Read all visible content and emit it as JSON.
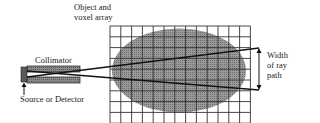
{
  "diagram": {
    "labels": {
      "object": [
        "Object and",
        "voxel array"
      ],
      "collimator": "Collimator",
      "source": "Source or Detector",
      "width": [
        "Width",
        "of ray",
        "path"
      ]
    },
    "grid": {
      "x": 110,
      "y": 26,
      "cols": 13,
      "rows": 9,
      "cell": 10.8,
      "color": "#333333"
    },
    "object_ellipse": {
      "cx": 179,
      "cy": 70.5,
      "rx": 67,
      "ry": 42,
      "fill": "#8c8c8c"
    },
    "collimator": {
      "upper_bar": {
        "x": 27,
        "y": 66,
        "w": 53,
        "h": 6
      },
      "lower_bar": {
        "x": 27,
        "y": 77,
        "w": 53,
        "h": 6
      },
      "fill": "#777777"
    },
    "source_block": {
      "x": 21,
      "y": 67,
      "w": 6,
      "h": 15,
      "fill": "#666666"
    },
    "rays": [
      {
        "x1": 27,
        "y1": 77,
        "x2": 259,
        "y2": 48
      },
      {
        "x1": 27,
        "y1": 71,
        "x2": 259,
        "y2": 90
      }
    ],
    "width_arrow": {
      "x": 259,
      "y1": 48,
      "y2": 90
    }
  }
}
